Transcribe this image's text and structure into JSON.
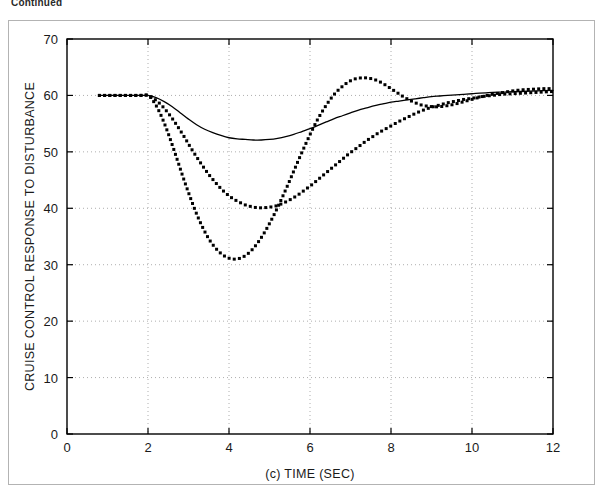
{
  "page": {
    "continued_label": "Continued"
  },
  "chart_data": {
    "type": "line",
    "title": "",
    "subtitle": "",
    "xlabel": "(c)  TIME (SEC)",
    "ylabel": "CRUISE CONTROL RESPONSE TO DISTURBANCE",
    "xlim": [
      0,
      12
    ],
    "ylim": [
      0,
      70
    ],
    "xticks": [
      0,
      2,
      4,
      6,
      8,
      10,
      12
    ],
    "yticks": [
      0,
      10,
      20,
      30,
      40,
      50,
      60,
      70
    ],
    "xtick_labels": [
      "0",
      "2",
      "4",
      "6",
      "8",
      "10",
      "12"
    ],
    "ytick_labels": [
      "0",
      "10",
      "20",
      "30",
      "40",
      "50",
      "60",
      "70"
    ],
    "grid": true,
    "grid_style": "dotted",
    "legend": "none",
    "series": [
      {
        "name": "solid-response",
        "style": "solid-line",
        "color": "#000000",
        "x": [
          0.8,
          1.0,
          1.2,
          1.4,
          1.6,
          1.8,
          2.0,
          2.2,
          2.4,
          2.6,
          2.8,
          3.0,
          3.2,
          3.4,
          3.6,
          3.8,
          4.0,
          4.2,
          4.4,
          4.6,
          4.8,
          5.0,
          5.2,
          5.4,
          5.6,
          5.8,
          6.0,
          6.2,
          6.4,
          6.6,
          6.8,
          7.0,
          7.2,
          7.4,
          7.6,
          7.8,
          8.0,
          8.2,
          8.4,
          8.6,
          8.8,
          9.0,
          9.2,
          9.4,
          9.6,
          9.8,
          10.0,
          10.4,
          10.8,
          11.2,
          11.6,
          12.0
        ],
        "y": [
          60.0,
          60.0,
          60.0,
          60.0,
          60.0,
          60.0,
          60.0,
          59.6,
          58.9,
          58.0,
          56.9,
          55.8,
          54.8,
          54.0,
          53.4,
          52.9,
          52.5,
          52.3,
          52.2,
          52.1,
          52.1,
          52.2,
          52.4,
          52.7,
          53.1,
          53.6,
          54.1,
          54.7,
          55.3,
          55.9,
          56.4,
          56.9,
          57.4,
          57.8,
          58.2,
          58.5,
          58.8,
          59.0,
          59.2,
          59.4,
          59.6,
          59.8,
          59.9,
          60.0,
          60.1,
          60.2,
          60.3,
          60.5,
          60.6,
          60.7,
          60.8,
          60.9
        ]
      },
      {
        "name": "medium-damped-response",
        "style": "dotted",
        "color": "#000000",
        "x": [
          0.8,
          1.0,
          1.2,
          1.4,
          1.6,
          1.8,
          2.0,
          2.15,
          2.3,
          2.45,
          2.6,
          2.75,
          2.9,
          3.05,
          3.2,
          3.35,
          3.5,
          3.65,
          3.8,
          3.95,
          4.1,
          4.25,
          4.4,
          4.55,
          4.7,
          4.85,
          5.0,
          5.15,
          5.3,
          5.45,
          5.6,
          5.75,
          5.9,
          6.05,
          6.2,
          6.35,
          6.5,
          6.65,
          6.8,
          6.95,
          7.1,
          7.25,
          7.4,
          7.55,
          7.7,
          7.85,
          8.0,
          8.2,
          8.4,
          8.6,
          8.8,
          9.0,
          9.2,
          9.4,
          9.6,
          9.8,
          10.0,
          10.25,
          10.5,
          10.75,
          11.0,
          11.25,
          11.5,
          11.75,
          12.0
        ],
        "y": [
          60.0,
          60.0,
          60.0,
          60.0,
          60.0,
          60.0,
          60.0,
          59.4,
          58.5,
          57.3,
          55.9,
          54.3,
          52.6,
          50.8,
          49.1,
          47.5,
          46.0,
          44.7,
          43.5,
          42.5,
          41.7,
          41.1,
          40.6,
          40.3,
          40.1,
          40.1,
          40.2,
          40.4,
          40.8,
          41.3,
          41.9,
          42.6,
          43.4,
          44.2,
          45.1,
          46.0,
          46.9,
          47.8,
          48.7,
          49.6,
          50.4,
          51.2,
          52.0,
          52.7,
          53.4,
          54.0,
          54.6,
          55.4,
          56.1,
          56.8,
          57.4,
          57.9,
          58.3,
          58.7,
          59.0,
          59.3,
          59.5,
          59.8,
          60.0,
          60.2,
          60.3,
          60.4,
          60.5,
          60.6,
          60.7
        ]
      },
      {
        "name": "underdamped-oscillatory-response",
        "style": "dotted",
        "color": "#000000",
        "x": [
          0.8,
          1.0,
          1.2,
          1.4,
          1.6,
          1.8,
          2.0,
          2.15,
          2.3,
          2.45,
          2.6,
          2.75,
          2.9,
          3.05,
          3.2,
          3.35,
          3.5,
          3.65,
          3.8,
          3.95,
          4.1,
          4.25,
          4.4,
          4.55,
          4.7,
          4.85,
          5.0,
          5.15,
          5.3,
          5.45,
          5.6,
          5.75,
          5.9,
          6.05,
          6.2,
          6.35,
          6.5,
          6.65,
          6.8,
          6.95,
          7.1,
          7.25,
          7.4,
          7.55,
          7.7,
          7.85,
          8.0,
          8.15,
          8.3,
          8.45,
          8.6,
          8.75,
          8.9,
          9.05,
          9.2,
          9.4,
          9.6,
          9.8,
          10.0,
          10.25,
          10.5,
          10.75,
          11.0,
          11.25,
          11.5,
          11.75,
          12.0
        ],
        "y": [
          60.0,
          60.0,
          60.0,
          60.0,
          60.0,
          60.0,
          60.0,
          58.8,
          56.8,
          54.2,
          51.2,
          48.0,
          44.8,
          41.8,
          39.0,
          36.6,
          34.6,
          33.1,
          32.0,
          31.3,
          31.0,
          31.1,
          31.6,
          32.5,
          33.8,
          35.4,
          37.3,
          39.4,
          41.7,
          44.1,
          46.6,
          49.1,
          51.5,
          53.8,
          55.9,
          57.7,
          59.3,
          60.6,
          61.6,
          62.4,
          62.9,
          63.1,
          63.1,
          62.9,
          62.5,
          61.9,
          61.2,
          60.5,
          59.8,
          59.2,
          58.7,
          58.3,
          58.1,
          58.0,
          58.0,
          58.2,
          58.5,
          58.9,
          59.3,
          59.8,
          60.2,
          60.5,
          60.8,
          61.0,
          61.1,
          61.2,
          61.2
        ]
      }
    ]
  }
}
